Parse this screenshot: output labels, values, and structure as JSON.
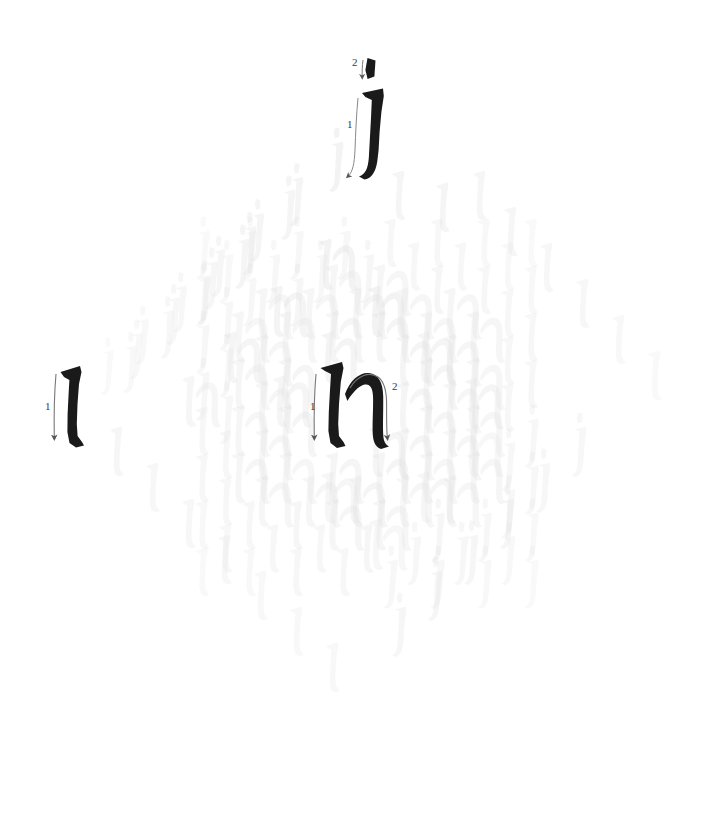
{
  "page": {
    "background_color": "#ffffff",
    "width": 715,
    "height": 813
  },
  "palette": {
    "ink_dark": "#1a1a1a",
    "ghost_light": "#ececec",
    "ghost_mid": "#e2e2e2",
    "ghost_dark": "#d6d6d6",
    "arrow": "#555555",
    "number": "#3a3a3a"
  },
  "exemplars": [
    {
      "id": "exemplar-l",
      "letter": "l",
      "name": "letter-l",
      "x": 72,
      "y": 408,
      "size": 92,
      "stroke_count": 1,
      "strokes": [
        {
          "number": "1",
          "direction": "down",
          "label_x": 50,
          "label_y": 408
        }
      ]
    },
    {
      "id": "exemplar-h",
      "letter": "h",
      "name": "letter-h",
      "x": 352,
      "y": 408,
      "size": 92,
      "stroke_count": 2,
      "strokes": [
        {
          "number": "1",
          "direction": "down",
          "label_x": 317,
          "label_y": 408
        },
        {
          "number": "2",
          "direction": "arch-over-and-down",
          "label_x": 393,
          "label_y": 388
        }
      ]
    },
    {
      "id": "exemplar-j",
      "letter": "j",
      "name": "letter-j",
      "x": 371,
      "y": 126,
      "size": 92,
      "stroke_count": 2,
      "strokes": [
        {
          "number": "1",
          "direction": "down-with-left-tail",
          "label_x": 354,
          "label_y": 124
        },
        {
          "number": "2",
          "direction": "dot-down",
          "label_x": 356,
          "label_y": 64
        }
      ]
    }
  ],
  "lattice": {
    "center_x": 368,
    "center_y": 408,
    "step_x": 47,
    "step_y": 47,
    "quadrants": [
      {
        "name": "top-left",
        "letter": "j",
        "rows": 7
      },
      {
        "name": "top-right",
        "letter": "l",
        "rows": 7
      },
      {
        "name": "bottom-left",
        "letter": "l",
        "rows": 7
      },
      {
        "name": "bottom-right",
        "letter": "j",
        "rows": 7
      },
      {
        "name": "center-band",
        "letter": "h",
        "rows": 7
      }
    ],
    "ghost_letters": [
      {
        "ch": "j",
        "x": 337,
        "y": 155,
        "s": 58,
        "o": 0.4
      },
      {
        "ch": "j",
        "x": 297,
        "y": 190,
        "s": 57,
        "o": 0.36
      },
      {
        "ch": "j",
        "x": 258,
        "y": 226,
        "s": 56,
        "o": 0.33
      },
      {
        "ch": "j",
        "x": 219,
        "y": 262,
        "s": 55,
        "o": 0.3
      },
      {
        "ch": "j",
        "x": 181,
        "y": 298,
        "s": 54,
        "o": 0.27
      },
      {
        "ch": "j",
        "x": 143,
        "y": 331,
        "s": 53,
        "o": 0.24
      },
      {
        "ch": "j",
        "x": 108,
        "y": 362,
        "s": 52,
        "o": 0.21
      },
      {
        "ch": "j",
        "x": 289,
        "y": 203,
        "s": 58,
        "o": 0.36
      },
      {
        "ch": "j",
        "x": 250,
        "y": 239,
        "s": 57,
        "o": 0.33
      },
      {
        "ch": "j",
        "x": 212,
        "y": 274,
        "s": 56,
        "o": 0.3
      },
      {
        "ch": "j",
        "x": 174,
        "y": 310,
        "s": 55,
        "o": 0.27
      },
      {
        "ch": "j",
        "x": 137,
        "y": 345,
        "s": 54,
        "o": 0.24
      },
      {
        "ch": "j",
        "x": 243,
        "y": 252,
        "s": 58,
        "o": 0.33
      },
      {
        "ch": "j",
        "x": 205,
        "y": 288,
        "s": 57,
        "o": 0.3
      },
      {
        "ch": "j",
        "x": 168,
        "y": 323,
        "s": 56,
        "o": 0.27
      },
      {
        "ch": "j",
        "x": 131,
        "y": 358,
        "s": 55,
        "o": 0.24
      },
      {
        "ch": "h",
        "x": 338,
        "y": 265,
        "s": 60,
        "o": 0.4
      },
      {
        "ch": "h",
        "x": 289,
        "y": 312,
        "s": 60,
        "o": 0.37
      },
      {
        "ch": "h",
        "x": 243,
        "y": 358,
        "s": 60,
        "o": 0.34
      },
      {
        "ch": "h",
        "x": 201,
        "y": 402,
        "s": 60,
        "o": 0.31
      },
      {
        "ch": "h",
        "x": 387,
        "y": 312,
        "s": 60,
        "o": 0.4
      },
      {
        "ch": "h",
        "x": 340,
        "y": 358,
        "s": 60,
        "o": 0.37
      },
      {
        "ch": "h",
        "x": 292,
        "y": 402,
        "s": 60,
        "o": 0.34
      },
      {
        "ch": "l",
        "x": 400,
        "y": 196,
        "s": 58,
        "o": 0.36
      },
      {
        "ch": "l",
        "x": 444,
        "y": 208,
        "s": 58,
        "o": 0.34
      },
      {
        "ch": "l",
        "x": 481,
        "y": 196,
        "s": 58,
        "o": 0.32
      },
      {
        "ch": "l",
        "x": 512,
        "y": 232,
        "s": 58,
        "o": 0.3
      },
      {
        "ch": "l",
        "x": 548,
        "y": 268,
        "s": 58,
        "o": 0.28
      },
      {
        "ch": "l",
        "x": 584,
        "y": 304,
        "s": 58,
        "o": 0.26
      },
      {
        "ch": "l",
        "x": 620,
        "y": 340,
        "s": 58,
        "o": 0.24
      },
      {
        "ch": "l",
        "x": 656,
        "y": 376,
        "s": 58,
        "o": 0.22
      },
      {
        "ch": "l",
        "x": 118,
        "y": 452,
        "s": 58,
        "o": 0.3
      },
      {
        "ch": "l",
        "x": 154,
        "y": 488,
        "s": 58,
        "o": 0.28
      },
      {
        "ch": "l",
        "x": 190,
        "y": 524,
        "s": 58,
        "o": 0.27
      },
      {
        "ch": "l",
        "x": 226,
        "y": 560,
        "s": 58,
        "o": 0.26
      },
      {
        "ch": "l",
        "x": 262,
        "y": 596,
        "s": 58,
        "o": 0.25
      },
      {
        "ch": "l",
        "x": 298,
        "y": 632,
        "s": 58,
        "o": 0.24
      },
      {
        "ch": "l",
        "x": 334,
        "y": 668,
        "s": 58,
        "o": 0.23
      },
      {
        "ch": "j",
        "x": 400,
        "y": 620,
        "s": 58,
        "o": 0.3
      },
      {
        "ch": "j",
        "x": 436,
        "y": 584,
        "s": 58,
        "o": 0.3
      },
      {
        "ch": "j",
        "x": 472,
        "y": 548,
        "s": 58,
        "o": 0.3
      },
      {
        "ch": "j",
        "x": 508,
        "y": 512,
        "s": 58,
        "o": 0.3
      },
      {
        "ch": "j",
        "x": 544,
        "y": 476,
        "s": 58,
        "o": 0.28
      },
      {
        "ch": "j",
        "x": 580,
        "y": 440,
        "s": 58,
        "o": 0.26
      },
      {
        "ch": "h",
        "x": 436,
        "y": 358,
        "s": 60,
        "o": 0.36
      },
      {
        "ch": "h",
        "x": 484,
        "y": 404,
        "s": 60,
        "o": 0.33
      },
      {
        "ch": "h",
        "x": 388,
        "y": 452,
        "s": 60,
        "o": 0.33
      },
      {
        "ch": "h",
        "x": 436,
        "y": 498,
        "s": 60,
        "o": 0.3
      },
      {
        "ch": "h",
        "x": 484,
        "y": 452,
        "s": 60,
        "o": 0.28
      },
      {
        "ch": "h",
        "x": 340,
        "y": 498,
        "s": 60,
        "o": 0.3
      },
      {
        "ch": "h",
        "x": 388,
        "y": 545,
        "s": 60,
        "o": 0.27
      }
    ]
  }
}
